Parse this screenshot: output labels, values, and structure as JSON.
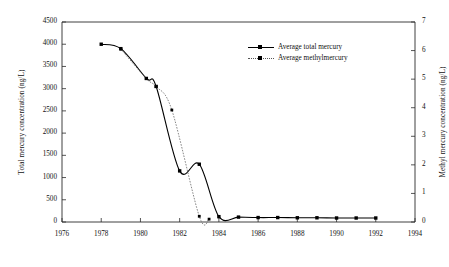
{
  "chart_data": {
    "type": "line",
    "title": "",
    "subtitle": "",
    "xlabel": "",
    "ylabel": "Total mercury concentration (ng/L)",
    "y2label": "Methyl mercury concentration (ng/L)",
    "xlim": [
      1976,
      1994
    ],
    "ylim": [
      0,
      4500
    ],
    "y2lim": [
      0,
      7
    ],
    "grid": false,
    "legend_position": "upper-right-inside",
    "x_ticks": [
      1976,
      1978,
      1980,
      1982,
      1984,
      1986,
      1988,
      1990,
      1992,
      1994
    ],
    "x_tick_labels": [
      "1976",
      "1978",
      "1980",
      "1982",
      "1984",
      "1986",
      "1988",
      "1990",
      "1992",
      "1994"
    ],
    "y_ticks": [
      0,
      500,
      1000,
      1500,
      2000,
      2500,
      3000,
      3500,
      4000,
      4500
    ],
    "y_tick_labels": [
      "0",
      "500",
      "1000",
      "1500",
      "2000",
      "2500",
      "3000",
      "3500",
      "4000",
      "4500"
    ],
    "y2_ticks": [
      0,
      1,
      2,
      3,
      4,
      5,
      6,
      7
    ],
    "y2_tick_labels": [
      "0",
      "1",
      "2",
      "3",
      "4",
      "5",
      "6",
      "7"
    ],
    "series": [
      {
        "name": "Average total mercury",
        "axis": "left",
        "line_style": "solid",
        "marker": "square",
        "color": "#000000",
        "x": [
          1978.0,
          1979.0,
          1980.3,
          1980.8,
          1982.0,
          1983.0,
          1984.0,
          1985.0,
          1986.0,
          1987.0,
          1988.0,
          1989.0,
          1990.0,
          1991.0,
          1992.0
        ],
        "values": [
          4000,
          3900,
          3230,
          3050,
          1150,
          1300,
          120,
          110,
          100,
          100,
          95,
          95,
          90,
          90,
          90
        ]
      },
      {
        "name": "Average methylmercury",
        "axis": "right",
        "line_style": "dashed",
        "marker": "square",
        "color": "#555555",
        "x": [
          1979.0,
          1980.3,
          1980.8,
          1981.6,
          1983.0,
          1983.5
        ],
        "values": [
          6.05,
          5.02,
          4.74,
          3.92,
          0.2,
          0.1
        ]
      }
    ]
  },
  "legend": {
    "entries": [
      {
        "label": "Average total mercury"
      },
      {
        "label": "Average methylmercury"
      }
    ]
  }
}
